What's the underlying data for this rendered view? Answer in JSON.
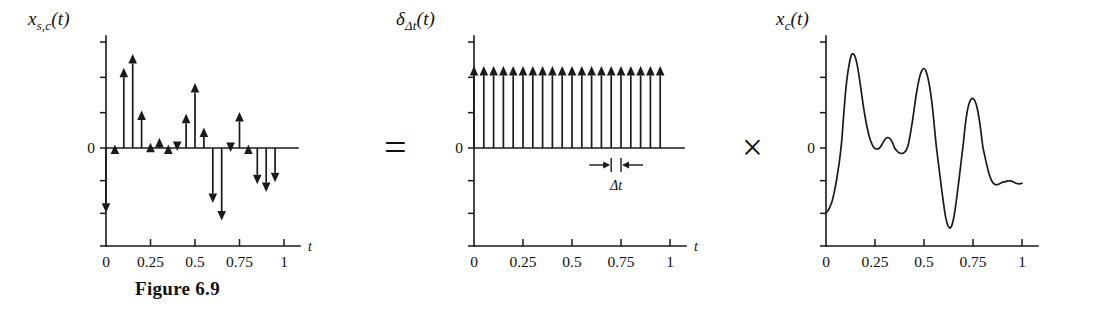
{
  "figure": {
    "caption": "Figure 6.9",
    "operators": {
      "equals": "=",
      "times": "×"
    }
  },
  "panels": {
    "left": {
      "label_main": "x",
      "label_sub": "s,c",
      "label_arg": "(t)",
      "axis_name": "t",
      "zero_label": "0",
      "xticks": [
        "0",
        "0.25",
        "0.5",
        "0.75",
        "1"
      ]
    },
    "middle": {
      "label_main": "δ",
      "label_sub": "Δt",
      "label_arg": "(t)",
      "axis_name": "t",
      "zero_label": "0",
      "xticks": [
        "0",
        "0.25",
        "0.5",
        "0.75",
        "1"
      ],
      "delta_label": "Δt"
    },
    "right": {
      "label_main": "x",
      "label_sub": "c",
      "label_arg": "(t)",
      "zero_label": "0",
      "xticks": [
        "0",
        "0.25",
        "0.5",
        "0.75",
        "1"
      ]
    }
  },
  "chart_data": [
    {
      "id": "sampled-signal",
      "type": "stem",
      "title": "x_{s,c}(t)",
      "xlabel": "t",
      "ylabel": "x_{s,c}(t)",
      "xlim": [
        0,
        1
      ],
      "ylim": [
        -1.0,
        0.62
      ],
      "grid": false,
      "legend": "none",
      "xticks": [
        0,
        0.25,
        0.5,
        0.75,
        1
      ],
      "sample_interval": 0.05,
      "x": [
        0.0,
        0.05,
        0.1,
        0.15,
        0.2,
        0.25,
        0.3,
        0.35,
        0.4,
        0.45,
        0.5,
        0.55,
        0.6,
        0.65,
        0.7,
        0.75,
        0.8,
        0.85,
        0.9,
        0.95
      ],
      "values": [
        -0.66,
        0.02,
        0.47,
        0.55,
        0.22,
        0.03,
        0.06,
        0.02,
        -0.03,
        0.2,
        0.38,
        0.12,
        -0.56,
        -0.74,
        -0.04,
        0.21,
        0.02,
        -0.37,
        -0.45,
        -0.35
      ]
    },
    {
      "id": "impulse-train",
      "type": "stem",
      "title": "δ_{Δt}(t)",
      "xlabel": "t",
      "ylabel": "δ_{Δt}(t)",
      "xlim": [
        0,
        1
      ],
      "ylim": [
        -1.0,
        0.62
      ],
      "grid": false,
      "legend": "none",
      "xticks": [
        0,
        0.25,
        0.5,
        0.75,
        1
      ],
      "sample_interval": 0.05,
      "annotation": "Δt",
      "annotation_span": [
        0.7,
        0.75
      ],
      "x": [
        0.0,
        0.05,
        0.1,
        0.15,
        0.2,
        0.25,
        0.3,
        0.35,
        0.4,
        0.45,
        0.5,
        0.55,
        0.6,
        0.65,
        0.7,
        0.75,
        0.8,
        0.85,
        0.9,
        0.95
      ],
      "values": [
        0.48,
        0.48,
        0.48,
        0.48,
        0.48,
        0.48,
        0.48,
        0.48,
        0.48,
        0.48,
        0.48,
        0.48,
        0.48,
        0.48,
        0.48,
        0.48,
        0.48,
        0.48,
        0.48,
        0.48
      ]
    },
    {
      "id": "continuous-signal",
      "type": "line",
      "title": "x_c(t)",
      "xlabel": "t",
      "ylabel": "x_c(t)",
      "xlim": [
        0,
        1
      ],
      "ylim": [
        -1.0,
        0.62
      ],
      "grid": false,
      "legend": "none",
      "xticks": [
        0,
        0.25,
        0.5,
        0.75,
        1
      ],
      "x": [
        0.0,
        0.01,
        0.02,
        0.03,
        0.04,
        0.05,
        0.06,
        0.07,
        0.08,
        0.09,
        0.1,
        0.11,
        0.12,
        0.13,
        0.14,
        0.15,
        0.16,
        0.17,
        0.18,
        0.19,
        0.2,
        0.21,
        0.22,
        0.23,
        0.24,
        0.25,
        0.26,
        0.27,
        0.28,
        0.29,
        0.3,
        0.31,
        0.32,
        0.33,
        0.34,
        0.35,
        0.36,
        0.37,
        0.38,
        0.39,
        0.4,
        0.41,
        0.42,
        0.43,
        0.44,
        0.45,
        0.46,
        0.47,
        0.48,
        0.49,
        0.5,
        0.51,
        0.52,
        0.53,
        0.54,
        0.55,
        0.56,
        0.57,
        0.58,
        0.59,
        0.6,
        0.61,
        0.62,
        0.63,
        0.64,
        0.65,
        0.66,
        0.67,
        0.68,
        0.69,
        0.7,
        0.71,
        0.72,
        0.73,
        0.74,
        0.75,
        0.76,
        0.77,
        0.78,
        0.79,
        0.8,
        0.81,
        0.82,
        0.83,
        0.84,
        0.85,
        0.86,
        0.87,
        0.88,
        0.89,
        0.9,
        0.91,
        0.92,
        0.93,
        0.94,
        0.95,
        0.96,
        0.97,
        0.98,
        0.99,
        1.0
      ],
      "values": [
        -0.66,
        -0.64,
        -0.6,
        -0.55,
        -0.47,
        -0.37,
        -0.25,
        -0.11,
        0.04,
        0.19,
        0.33,
        0.43,
        0.5,
        0.545,
        0.55,
        0.53,
        0.48,
        0.41,
        0.33,
        0.25,
        0.18,
        0.12,
        0.07,
        0.035,
        0.01,
        -0.005,
        -0.01,
        -0.005,
        0.01,
        0.03,
        0.05,
        0.06,
        0.06,
        0.05,
        0.03,
        0.0,
        -0.025,
        -0.045,
        -0.055,
        -0.055,
        -0.045,
        -0.02,
        0.02,
        0.08,
        0.15,
        0.23,
        0.31,
        0.375,
        0.425,
        0.455,
        0.465,
        0.45,
        0.41,
        0.35,
        0.27,
        0.16,
        0.04,
        -0.1,
        -0.26,
        -0.42,
        -0.57,
        -0.7,
        -0.78,
        -0.815,
        -0.8,
        -0.73,
        -0.61,
        -0.46,
        -0.3,
        -0.13,
        0.02,
        0.13,
        0.21,
        0.26,
        0.285,
        0.29,
        0.275,
        0.24,
        0.18,
        0.1,
        0.01,
        -0.08,
        -0.17,
        -0.25,
        -0.31,
        -0.35,
        -0.37,
        -0.375,
        -0.37,
        -0.36,
        -0.35,
        -0.345,
        -0.34,
        -0.335,
        -0.335,
        -0.34,
        -0.35,
        -0.36,
        -0.365,
        -0.365,
        -0.36
      ]
    }
  ]
}
